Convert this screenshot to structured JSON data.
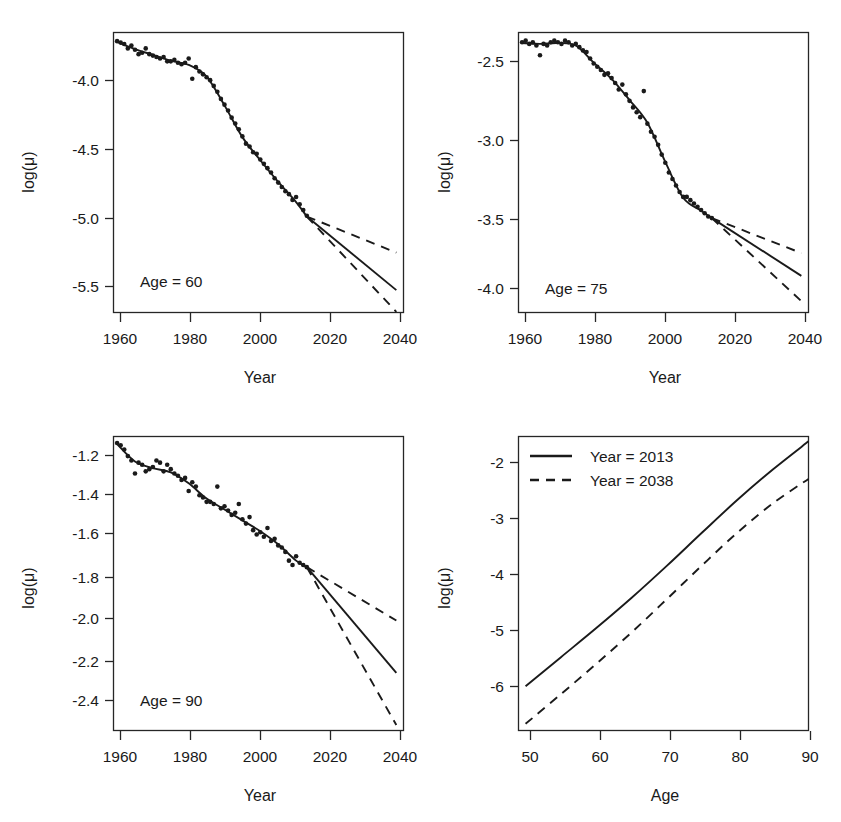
{
  "figure": {
    "background": "#ffffff",
    "ink_color": "#1a1a1a",
    "panel_count": 4,
    "layout": "2x2 grid"
  },
  "chart_data": [
    {
      "id": "panel-age-60",
      "type": "line",
      "title": "",
      "annotation": "Age = 60",
      "xlabel": "Year",
      "ylabel": "log(μ)",
      "xlim": [
        1959,
        2040
      ],
      "ylim": [
        -5.62,
        -3.68
      ],
      "xticks": [
        1960,
        1980,
        2000,
        2020,
        2040
      ],
      "xticklabels": [
        "1960",
        "1980",
        "2000",
        "2020",
        "2040"
      ],
      "yticks": [
        -4.0,
        -4.5,
        -5.0,
        -5.5
      ],
      "yticklabels": [
        "-4.0",
        "-4.5",
        "-5.0",
        "-5.5"
      ],
      "grid": false,
      "legend": "none",
      "series": [
        {
          "name": "observed",
          "style": "points",
          "x": [
            1960,
            1961,
            1962,
            1963,
            1964,
            1965,
            1966,
            1967,
            1968,
            1969,
            1970,
            1971,
            1972,
            1973,
            1974,
            1975,
            1976,
            1977,
            1978,
            1979,
            1980,
            1981,
            1982,
            1983,
            1984,
            1985,
            1986,
            1987,
            1988,
            1989,
            1990,
            1991,
            1992,
            1993,
            1994,
            1995,
            1996,
            1997,
            1998,
            1999,
            2000,
            2001,
            2002,
            2003,
            2004,
            2005,
            2006,
            2007,
            2008,
            2009,
            2010,
            2011,
            2012,
            2013
          ],
          "values": [
            -3.74,
            -3.75,
            -3.76,
            -3.79,
            -3.77,
            -3.8,
            -3.83,
            -3.82,
            -3.79,
            -3.83,
            -3.84,
            -3.85,
            -3.86,
            -3.85,
            -3.88,
            -3.88,
            -3.87,
            -3.89,
            -3.9,
            -3.89,
            -3.86,
            -4.0,
            -3.92,
            -3.95,
            -3.97,
            -3.99,
            -4.01,
            -4.05,
            -4.09,
            -4.14,
            -4.18,
            -4.22,
            -4.27,
            -4.31,
            -4.35,
            -4.4,
            -4.45,
            -4.47,
            -4.51,
            -4.52,
            -4.56,
            -4.59,
            -4.62,
            -4.65,
            -4.69,
            -4.72,
            -4.75,
            -4.78,
            -4.8,
            -4.84,
            -4.82,
            -4.87,
            -4.91,
            -4.95
          ]
        },
        {
          "name": "fitted",
          "style": "solid-line",
          "x": [
            1960,
            1965,
            1970,
            1975,
            1980,
            1985,
            1990,
            1995,
            2000,
            2005,
            2010,
            2013
          ],
          "values": [
            -3.745,
            -3.795,
            -3.835,
            -3.875,
            -3.905,
            -3.985,
            -4.185,
            -4.405,
            -4.565,
            -4.715,
            -4.855,
            -4.955
          ]
        },
        {
          "name": "forecast",
          "style": "solid-line",
          "x": [
            2013,
            2038
          ],
          "values": [
            -4.955,
            -5.465
          ],
          "description": "central projection to 2038"
        },
        {
          "name": "forecast-upper-95",
          "style": "dashed-line",
          "x": [
            2013,
            2038
          ],
          "values": [
            -4.955,
            -5.205
          ]
        },
        {
          "name": "forecast-lower-95",
          "style": "dashed-line",
          "x": [
            2013,
            2038
          ],
          "values": [
            -4.955,
            -5.615
          ]
        }
      ]
    },
    {
      "id": "panel-age-75",
      "type": "line",
      "title": "",
      "annotation": "Age = 75",
      "xlabel": "Year",
      "ylabel": "log(μ)",
      "xlim": [
        1959,
        2040
      ],
      "ylim": [
        -4.08,
        -2.36
      ],
      "xticks": [
        1960,
        1980,
        2000,
        2020,
        2040
      ],
      "xticklabels": [
        "1960",
        "1980",
        "2000",
        "2020",
        "2040"
      ],
      "yticks": [
        -2.5,
        -3.0,
        -3.5,
        -4.0
      ],
      "yticklabels": [
        "-2.5",
        "-3.0",
        "-3.5",
        "-4.0"
      ],
      "grid": false,
      "legend": "none",
      "series": [
        {
          "name": "observed",
          "style": "points",
          "x": [
            1960,
            1961,
            1962,
            1963,
            1964,
            1965,
            1966,
            1967,
            1968,
            1969,
            1970,
            1971,
            1972,
            1973,
            1974,
            1975,
            1976,
            1977,
            1978,
            1979,
            1980,
            1981,
            1982,
            1983,
            1984,
            1985,
            1986,
            1987,
            1988,
            1989,
            1990,
            1991,
            1992,
            1993,
            1994,
            1995,
            1996,
            1997,
            1998,
            1999,
            2000,
            2001,
            2002,
            2003,
            2004,
            2005,
            2006,
            2007,
            2008,
            2009,
            2010,
            2011,
            2012,
            2013
          ],
          "values": [
            -2.42,
            -2.41,
            -2.43,
            -2.42,
            -2.44,
            -2.5,
            -2.43,
            -2.44,
            -2.42,
            -2.41,
            -2.42,
            -2.43,
            -2.41,
            -2.42,
            -2.44,
            -2.43,
            -2.45,
            -2.47,
            -2.48,
            -2.52,
            -2.55,
            -2.57,
            -2.59,
            -2.62,
            -2.61,
            -2.64,
            -2.67,
            -2.71,
            -2.68,
            -2.74,
            -2.78,
            -2.82,
            -2.85,
            -2.88,
            -2.72,
            -2.92,
            -2.97,
            -3.0,
            -3.05,
            -3.11,
            -3.16,
            -3.22,
            -3.26,
            -3.3,
            -3.34,
            -3.37,
            -3.37,
            -3.39,
            -3.41,
            -3.43,
            -3.45,
            -3.47,
            -3.49,
            -3.5
          ]
        },
        {
          "name": "fitted",
          "style": "solid-line",
          "x": [
            1960,
            1965,
            1970,
            1975,
            1980,
            1985,
            1990,
            1995,
            2000,
            2005,
            2010,
            2013
          ],
          "values": [
            -2.425,
            -2.43,
            -2.425,
            -2.44,
            -2.545,
            -2.645,
            -2.775,
            -2.915,
            -3.155,
            -3.375,
            -3.455,
            -3.5
          ]
        },
        {
          "name": "forecast",
          "style": "solid-line",
          "x": [
            2013,
            2038
          ],
          "values": [
            -3.5,
            -3.855
          ]
        },
        {
          "name": "forecast-upper-95",
          "style": "dashed-line",
          "x": [
            2013,
            2038
          ],
          "values": [
            -3.5,
            -3.715
          ]
        },
        {
          "name": "forecast-lower-95",
          "style": "dashed-line",
          "x": [
            2013,
            2038
          ],
          "values": [
            -3.5,
            -4.01
          ]
        }
      ]
    },
    {
      "id": "panel-age-90",
      "type": "line",
      "title": "",
      "annotation": "Age = 90",
      "xlabel": "Year",
      "ylabel": "log(μ)",
      "xlim": [
        1959,
        2040
      ],
      "ylim": [
        -2.48,
        -1.13
      ],
      "xticks": [
        1960,
        1980,
        2000,
        2020,
        2040
      ],
      "xticklabels": [
        "1960",
        "1980",
        "2000",
        "2020",
        "2040"
      ],
      "yticks": [
        -1.2,
        -1.4,
        -1.6,
        -1.8,
        -2.0,
        -2.2,
        -2.4
      ],
      "yticklabels": [
        "-1.2",
        "-1.4",
        "-1.6",
        "-1.8",
        "-2.0",
        "-2.2",
        "-2.4"
      ],
      "grid": false,
      "legend": "none",
      "series": [
        {
          "name": "observed",
          "style": "points",
          "x": [
            1960,
            1961,
            1962,
            1963,
            1964,
            1965,
            1966,
            1967,
            1968,
            1969,
            1970,
            1971,
            1972,
            1973,
            1974,
            1975,
            1976,
            1977,
            1978,
            1979,
            1980,
            1981,
            1982,
            1983,
            1984,
            1985,
            1986,
            1987,
            1988,
            1989,
            1990,
            1991,
            1992,
            1993,
            1994,
            1995,
            1996,
            1997,
            1998,
            1999,
            2000,
            2001,
            2002,
            2003,
            2004,
            2005,
            2006,
            2007,
            2008,
            2009,
            2010,
            2011,
            2012,
            2013
          ],
          "values": [
            -1.16,
            -1.17,
            -1.19,
            -1.22,
            -1.24,
            -1.3,
            -1.25,
            -1.26,
            -1.29,
            -1.28,
            -1.27,
            -1.24,
            -1.25,
            -1.29,
            -1.26,
            -1.28,
            -1.3,
            -1.31,
            -1.33,
            -1.32,
            -1.38,
            -1.34,
            -1.36,
            -1.4,
            -1.41,
            -1.43,
            -1.43,
            -1.44,
            -1.36,
            -1.46,
            -1.45,
            -1.47,
            -1.49,
            -1.48,
            -1.44,
            -1.51,
            -1.53,
            -1.5,
            -1.56,
            -1.58,
            -1.57,
            -1.59,
            -1.55,
            -1.61,
            -1.6,
            -1.63,
            -1.64,
            -1.66,
            -1.7,
            -1.72,
            -1.68,
            -1.71,
            -1.72,
            -1.73
          ]
        },
        {
          "name": "fitted",
          "style": "solid-line",
          "x": [
            1960,
            1965,
            1970,
            1975,
            1980,
            1985,
            1990,
            1995,
            2000,
            2005,
            2010,
            2013
          ],
          "values": [
            -1.165,
            -1.245,
            -1.275,
            -1.295,
            -1.345,
            -1.415,
            -1.465,
            -1.515,
            -1.565,
            -1.625,
            -1.7,
            -1.73
          ]
        },
        {
          "name": "forecast",
          "style": "solid-line",
          "x": [
            2013,
            2038
          ],
          "values": [
            -1.73,
            -2.215
          ]
        },
        {
          "name": "forecast-upper-95",
          "style": "dashed-line",
          "x": [
            2013,
            2038
          ],
          "values": [
            -1.73,
            -1.975
          ]
        },
        {
          "name": "forecast-lower-95",
          "style": "dashed-line",
          "x": [
            2013,
            2038
          ],
          "values": [
            -1.73,
            -2.455
          ]
        }
      ]
    },
    {
      "id": "panel-age-profile",
      "type": "line",
      "title": "",
      "annotation": "",
      "xlabel": "Age",
      "ylabel": "log(μ)",
      "xlim": [
        49,
        90
      ],
      "ylim": [
        -6.45,
        -1.6
      ],
      "xticks": [
        50,
        60,
        70,
        80,
        90
      ],
      "xticklabels": [
        "50",
        "60",
        "70",
        "80",
        "90"
      ],
      "yticks": [
        -2,
        -3,
        -4,
        -5,
        -6
      ],
      "yticklabels": [
        "-2",
        "-3",
        "-4",
        "-5",
        "-6"
      ],
      "grid": false,
      "legend": "top-left",
      "legend_entries": [
        "Year = 2013",
        "Year = 2038"
      ],
      "series": [
        {
          "name": "Year = 2013",
          "style": "solid-line",
          "x": [
            50,
            55,
            60,
            65,
            70,
            75,
            80,
            85,
            90
          ],
          "values": [
            -5.72,
            -5.24,
            -4.76,
            -4.26,
            -3.73,
            -3.18,
            -2.64,
            -2.14,
            -1.68
          ]
        },
        {
          "name": "Year = 2038",
          "style": "dashed-line",
          "x": [
            50,
            55,
            60,
            65,
            70,
            75,
            80,
            85,
            90
          ],
          "values": [
            -6.34,
            -5.85,
            -5.35,
            -4.83,
            -4.28,
            -3.72,
            -3.18,
            -2.7,
            -2.3
          ]
        }
      ]
    }
  ]
}
